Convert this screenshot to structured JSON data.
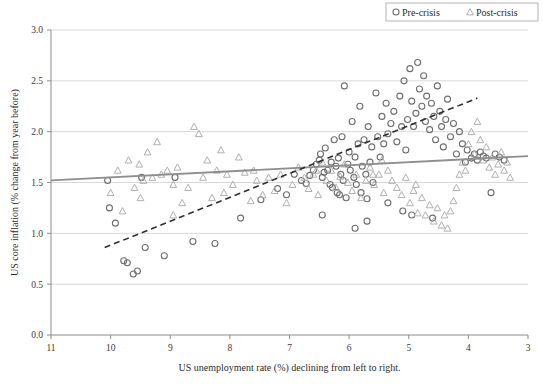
{
  "chart_data": {
    "type": "scatter",
    "title": "",
    "xlabel": "US unemployment rate (%) declining from left to right.",
    "ylabel": "US core inflation (% change from year before)",
    "xlim": [
      11,
      3
    ],
    "ylim": [
      0.0,
      3.0
    ],
    "x_ticks": [
      11,
      10,
      9,
      8,
      7,
      6,
      5,
      4,
      3
    ],
    "x_tick_labels": [
      "11",
      "10",
      "9",
      "8",
      "7",
      "6",
      "5",
      "4",
      "3"
    ],
    "y_ticks": [
      0.0,
      0.5,
      1.0,
      1.5,
      2.0,
      2.5,
      3.0
    ],
    "y_tick_labels": [
      "0.0",
      "0.5",
      "1.0",
      "1.5",
      "2.0",
      "2.5",
      "3.0"
    ],
    "x_axis_reversed": true,
    "grid": "horizontal",
    "legend_position": "top-right",
    "series": [
      {
        "name": "Pre-crisis",
        "marker": "circle",
        "color": "#6e6e6e",
        "points": [
          [
            10.05,
            1.52
          ],
          [
            10.02,
            1.25
          ],
          [
            9.92,
            1.1
          ],
          [
            9.78,
            0.73
          ],
          [
            9.72,
            0.71
          ],
          [
            9.62,
            0.6
          ],
          [
            9.55,
            0.63
          ],
          [
            9.48,
            1.55
          ],
          [
            9.42,
            0.86
          ],
          [
            9.1,
            0.78
          ],
          [
            8.92,
            1.55
          ],
          [
            8.62,
            0.92
          ],
          [
            8.25,
            0.9
          ],
          [
            7.82,
            1.15
          ],
          [
            7.48,
            1.33
          ],
          [
            7.2,
            1.44
          ],
          [
            7.05,
            1.38
          ],
          [
            6.92,
            1.58
          ],
          [
            6.8,
            1.52
          ],
          [
            6.72,
            1.49
          ],
          [
            6.66,
            1.57
          ],
          [
            6.6,
            1.62
          ],
          [
            6.55,
            1.68
          ],
          [
            6.5,
            1.72
          ],
          [
            6.48,
            1.78
          ],
          [
            6.45,
            1.55
          ],
          [
            6.42,
            1.6
          ],
          [
            6.4,
            1.84
          ],
          [
            6.36,
            1.62
          ],
          [
            6.32,
            1.48
          ],
          [
            6.3,
            1.7
          ],
          [
            6.28,
            1.45
          ],
          [
            6.25,
            1.92
          ],
          [
            6.22,
            1.66
          ],
          [
            6.2,
            1.4
          ],
          [
            6.18,
            1.74
          ],
          [
            6.16,
            1.38
          ],
          [
            6.14,
            1.58
          ],
          [
            6.12,
            1.95
          ],
          [
            6.1,
            1.52
          ],
          [
            6.08,
            2.45
          ],
          [
            6.05,
            1.35
          ],
          [
            6.02,
            1.68
          ],
          [
            6.0,
            1.8
          ],
          [
            5.98,
            1.62
          ],
          [
            5.95,
            2.1
          ],
          [
            5.92,
            1.55
          ],
          [
            5.9,
            1.75
          ],
          [
            5.88,
            1.48
          ],
          [
            5.85,
            1.88
          ],
          [
            5.82,
            2.25
          ],
          [
            5.8,
            1.4
          ],
          [
            5.78,
            1.66
          ],
          [
            5.75,
            1.92
          ],
          [
            5.72,
            1.58
          ],
          [
            5.7,
            1.34
          ],
          [
            5.68,
            2.05
          ],
          [
            5.65,
            1.7
          ],
          [
            5.62,
            1.85
          ],
          [
            5.6,
            1.5
          ],
          [
            5.55,
            2.38
          ],
          [
            5.52,
            1.95
          ],
          [
            5.48,
            1.75
          ],
          [
            5.45,
            2.15
          ],
          [
            5.42,
            1.88
          ],
          [
            5.38,
            2.28
          ],
          [
            5.35,
            1.98
          ],
          [
            5.3,
            2.08
          ],
          [
            5.25,
            2.2
          ],
          [
            5.2,
            1.9
          ],
          [
            5.15,
            2.35
          ],
          [
            5.12,
            2.05
          ],
          [
            5.08,
            2.5
          ],
          [
            5.05,
            1.82
          ],
          [
            5.02,
            2.12
          ],
          [
            4.98,
            2.62
          ],
          [
            4.95,
            2.3
          ],
          [
            4.92,
            2.05
          ],
          [
            4.88,
            2.18
          ],
          [
            4.85,
            2.68
          ],
          [
            4.82,
            2.42
          ],
          [
            4.78,
            2.25
          ],
          [
            4.75,
            2.55
          ],
          [
            4.72,
            2.1
          ],
          [
            4.7,
            2.35
          ],
          [
            4.65,
            2.02
          ],
          [
            4.62,
            2.28
          ],
          [
            4.58,
            2.15
          ],
          [
            4.55,
            1.92
          ],
          [
            4.52,
            2.45
          ],
          [
            4.48,
            2.2
          ],
          [
            4.45,
            2.05
          ],
          [
            4.42,
            1.85
          ],
          [
            4.38,
            2.12
          ],
          [
            4.35,
            2.32
          ],
          [
            4.3,
            1.95
          ],
          [
            4.25,
            2.08
          ],
          [
            4.2,
            1.78
          ],
          [
            4.15,
            2.0
          ],
          [
            4.1,
            1.88
          ],
          [
            4.05,
            1.7
          ],
          [
            4.02,
            1.82
          ],
          [
            3.95,
            1.74
          ],
          [
            3.9,
            1.78
          ],
          [
            3.85,
            1.72
          ],
          [
            3.8,
            1.8
          ],
          [
            3.75,
            1.76
          ],
          [
            3.7,
            1.74
          ],
          [
            3.62,
            1.4
          ],
          [
            3.55,
            1.78
          ],
          [
            3.48,
            1.75
          ],
          [
            3.4,
            1.72
          ],
          [
            5.35,
            1.3
          ],
          [
            5.1,
            1.22
          ],
          [
            4.95,
            1.18
          ],
          [
            5.7,
            1.12
          ],
          [
            6.45,
            1.18
          ],
          [
            5.9,
            1.05
          ],
          [
            4.6,
            1.15
          ]
        ]
      },
      {
        "name": "Post-crisis",
        "marker": "triangle",
        "color": "#b0b0b0",
        "points": [
          [
            10.0,
            1.4
          ],
          [
            9.88,
            1.62
          ],
          [
            9.8,
            1.22
          ],
          [
            9.7,
            1.72
          ],
          [
            9.6,
            1.45
          ],
          [
            9.52,
            1.68
          ],
          [
            9.45,
            1.52
          ],
          [
            9.38,
            1.8
          ],
          [
            9.3,
            1.55
          ],
          [
            9.22,
            1.9
          ],
          [
            9.15,
            1.58
          ],
          [
            9.05,
            1.62
          ],
          [
            8.95,
            1.48
          ],
          [
            8.88,
            1.65
          ],
          [
            8.8,
            1.3
          ],
          [
            8.7,
            1.45
          ],
          [
            8.6,
            2.05
          ],
          [
            8.52,
            1.98
          ],
          [
            8.45,
            1.55
          ],
          [
            8.38,
            1.72
          ],
          [
            8.3,
            1.35
          ],
          [
            8.22,
            1.62
          ],
          [
            8.15,
            1.82
          ],
          [
            8.05,
            1.58
          ],
          [
            7.95,
            1.48
          ],
          [
            7.85,
            1.75
          ],
          [
            7.75,
            1.6
          ],
          [
            7.65,
            1.32
          ],
          [
            7.55,
            1.52
          ],
          [
            7.45,
            1.38
          ],
          [
            7.35,
            1.55
          ],
          [
            7.25,
            1.42
          ],
          [
            7.15,
            1.58
          ],
          [
            7.05,
            1.3
          ],
          [
            6.95,
            1.48
          ],
          [
            6.85,
            1.65
          ],
          [
            6.75,
            1.55
          ],
          [
            6.68,
            1.44
          ],
          [
            6.6,
            1.58
          ],
          [
            6.52,
            1.38
          ],
          [
            6.45,
            1.7
          ],
          [
            6.38,
            1.52
          ],
          [
            6.3,
            1.62
          ],
          [
            6.22,
            1.45
          ],
          [
            6.15,
            1.56
          ],
          [
            6.08,
            1.68
          ],
          [
            6.02,
            1.5
          ],
          [
            5.95,
            1.42
          ],
          [
            5.88,
            1.58
          ],
          [
            5.8,
            1.35
          ],
          [
            5.72,
            1.52
          ],
          [
            5.65,
            1.65
          ],
          [
            5.58,
            1.48
          ],
          [
            5.5,
            1.58
          ],
          [
            5.42,
            1.4
          ],
          [
            5.35,
            1.62
          ],
          [
            5.28,
            1.52
          ],
          [
            5.2,
            1.45
          ],
          [
            5.12,
            1.38
          ],
          [
            5.05,
            1.55
          ],
          [
            4.98,
            1.3
          ],
          [
            4.92,
            1.42
          ],
          [
            4.85,
            1.2
          ],
          [
            4.78,
            1.35
          ],
          [
            4.72,
            1.18
          ],
          [
            4.65,
            1.28
          ],
          [
            4.58,
            1.12
          ],
          [
            4.52,
            1.25
          ],
          [
            4.45,
            1.08
          ],
          [
            4.4,
            1.18
          ],
          [
            4.35,
            1.05
          ],
          [
            4.3,
            1.22
          ],
          [
            4.25,
            1.32
          ],
          [
            4.2,
            1.45
          ],
          [
            4.15,
            1.58
          ],
          [
            4.1,
            1.7
          ],
          [
            4.05,
            1.62
          ],
          [
            4.0,
            1.88
          ],
          [
            3.95,
            2.0
          ],
          [
            3.9,
            1.78
          ],
          [
            3.85,
            2.1
          ],
          [
            3.8,
            1.92
          ],
          [
            3.75,
            1.72
          ],
          [
            3.7,
            1.85
          ],
          [
            3.65,
            1.65
          ],
          [
            3.6,
            1.75
          ],
          [
            3.55,
            1.58
          ],
          [
            3.5,
            1.68
          ],
          [
            3.45,
            1.8
          ],
          [
            3.4,
            1.62
          ],
          [
            3.35,
            1.7
          ],
          [
            3.3,
            1.55
          ],
          [
            5.6,
            1.58
          ],
          [
            5.45,
            1.72
          ],
          [
            4.88,
            1.48
          ],
          [
            6.55,
            1.62
          ],
          [
            7.6,
            1.62
          ],
          [
            8.1,
            1.4
          ],
          [
            9.5,
            1.35
          ],
          [
            8.95,
            1.18
          ]
        ]
      }
    ],
    "trend_lines": [
      {
        "name": "Post-crisis trend",
        "style": "solid",
        "color": "#8e8e8e",
        "x0": 11.0,
        "y0": 1.52,
        "x1": 3.0,
        "y1": 1.76
      },
      {
        "name": "Pre-crisis trend",
        "style": "dashed",
        "color": "#2f2f2f",
        "x0": 10.1,
        "y0": 0.86,
        "x1": 3.85,
        "y1": 2.33
      }
    ]
  },
  "legend": {
    "items": [
      {
        "label": "Pre-crisis",
        "marker": "circle"
      },
      {
        "label": "Post-crisis",
        "marker": "triangle"
      }
    ]
  }
}
